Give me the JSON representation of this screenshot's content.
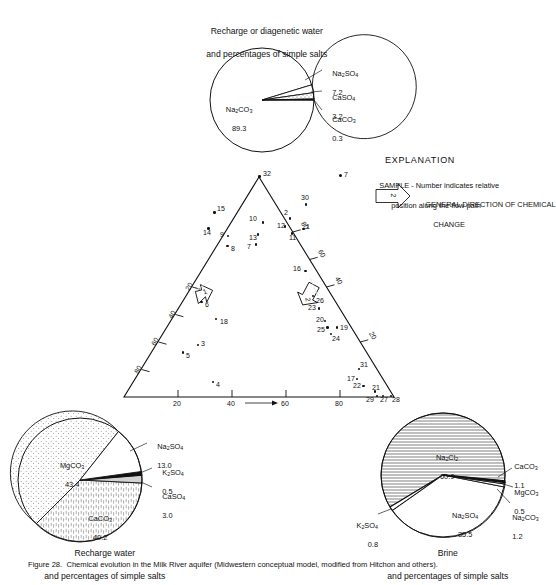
{
  "figure": {
    "caption": "Figure 28.  Chemical evolution in the Milk River aquifer (Midwestern conceptual model, modified from Hitchon and others)."
  },
  "top_pie": {
    "title_line1": "Recharge or diagenetic water",
    "title_line2": "and percentages of simple salts",
    "slices": [
      {
        "name": "Na2CO3",
        "label_html": "Na<sub>2</sub>CO<sub>3</sub>",
        "value": "89.3",
        "fill": "white"
      },
      {
        "name": "Na2SO4",
        "label_html": "Na<sub>2</sub>SO<sub>4</sub>",
        "value": "7.2",
        "fill": "white"
      },
      {
        "name": "CaSO4",
        "label_html": "CaSO<sub>4</sub>",
        "value": "3.2",
        "fill": "dots"
      },
      {
        "name": "CaCO3",
        "label_html": "CaCO<sub>3</sub>",
        "value": "0.3",
        "fill": "black"
      }
    ]
  },
  "left_pie": {
    "title_line1": "Recharge water",
    "title_line2": "and percentages of simple salts",
    "slices": [
      {
        "name": "MgCO3",
        "label_html": "MgCO<sub>3</sub>",
        "value": "43.4",
        "fill": "dots"
      },
      {
        "name": "CaCO3",
        "label_html": "CaCO<sub>3</sub>",
        "value": "40.2",
        "fill": "dashes"
      },
      {
        "name": "Na2SO4",
        "label_html": "Na<sub>2</sub>SO<sub>4</sub>",
        "value": "13.0",
        "fill": "white"
      },
      {
        "name": "K2SO4",
        "label_html": "K<sub>2</sub>SO<sub>4</sub>",
        "value": "0.5",
        "fill": "black"
      },
      {
        "name": "CaSO4",
        "label_html": "CaSO<sub>4</sub>",
        "value": "3.0",
        "fill": "gray"
      }
    ]
  },
  "right_pie": {
    "title_line1": "Brine",
    "title_line2": "and percentages of simple salts",
    "slices": [
      {
        "name": "Na2Cl2",
        "label_html": "Na<sub>2</sub>Cl<sub>2</sub>",
        "value": "60.9",
        "fill": "hlines"
      },
      {
        "name": "Na2SO4",
        "label_html": "Na<sub>2</sub>SO<sub>4</sub>",
        "value": "35.5",
        "fill": "white"
      },
      {
        "name": "CaCO3",
        "label_html": "CaCO<sub>3</sub>",
        "value": "1.1",
        "fill": "black"
      },
      {
        "name": "MgCO3",
        "label_html": "MgCO<sub>3</sub>",
        "value": "0.5",
        "fill": "white"
      },
      {
        "name": "Na2CO3",
        "label_html": "Na<sub>2</sub>CO<sub>3</sub>",
        "value": "1.2",
        "fill": "white"
      },
      {
        "name": "K2SO4",
        "label_html": "K<sub>2</sub>SO<sub>4</sub>",
        "value": "0.8",
        "fill": "white"
      }
    ]
  },
  "explanation": {
    "heading": "EXPLANATION",
    "sample_marker": "7",
    "sample_line1": "SAMPLE - Number indicates relative",
    "sample_line2": "position along the flow path",
    "arrow_marker": "2",
    "direction_line1": "GENERAL DIRECTION OF CHEMICAL",
    "direction_line2": "CHANGE"
  },
  "ternary": {
    "left_axis_ticks": [
      "20",
      "40",
      "60",
      "80"
    ],
    "right_axis_ticks": [
      "80",
      "60",
      "40",
      "20"
    ],
    "bottom_axis_ticks": [
      "20",
      "40",
      "60",
      "80"
    ],
    "arrow_labels": [
      "1",
      "2"
    ],
    "samples": [
      {
        "id": "32",
        "x": 259.5,
        "y": 176.5,
        "lx": 263,
        "ly": 172
      },
      {
        "id": "30",
        "x": 306.0,
        "y": 204.5,
        "lx": 301,
        "ly": 196
      },
      {
        "id": "15",
        "x": 214.5,
        "y": 212.5,
        "lx": 217,
        "ly": 207
      },
      {
        "id": "2",
        "x": 290.0,
        "y": 218.5,
        "lx": 284,
        "ly": 211
      },
      {
        "id": "10",
        "x": 263.0,
        "y": 222.5,
        "lx": 249,
        "ly": 217
      },
      {
        "id": "12",
        "x": 285.0,
        "y": 226.5,
        "lx": 277,
        "ly": 224
      },
      {
        "id": "1",
        "x": 303.5,
        "y": 229.0,
        "lx": 306,
        "ly": 225
      },
      {
        "id": "14",
        "x": 208.5,
        "y": 228.5,
        "lx": 203,
        "ly": 231
      },
      {
        "id": "11",
        "x": 292.0,
        "y": 233.5,
        "lx": 289,
        "ly": 236
      },
      {
        "id": "9",
        "x": 228.0,
        "y": 236.0,
        "lx": 220,
        "ly": 233
      },
      {
        "id": "13",
        "x": 258.0,
        "y": 234.5,
        "lx": 249,
        "ly": 236
      },
      {
        "id": "8",
        "x": 227.5,
        "y": 246.0,
        "lx": 231,
        "ly": 247
      },
      {
        "id": "7",
        "x": 256.0,
        "y": 244.5,
        "lx": 247,
        "ly": 245
      },
      {
        "id": "16",
        "x": 305.5,
        "y": 271.0,
        "lx": 293,
        "ly": 267
      },
      {
        "id": "26",
        "x": 313.0,
        "y": 296.0,
        "lx": 316,
        "ly": 299
      },
      {
        "id": "6",
        "x": 201.5,
        "y": 302.0,
        "lx": 205,
        "ly": 303
      },
      {
        "id": "23",
        "x": 319.0,
        "y": 308.5,
        "lx": 308,
        "ly": 306
      },
      {
        "id": "18",
        "x": 216.0,
        "y": 319.0,
        "lx": 220,
        "ly": 320
      },
      {
        "id": "20",
        "x": 325.0,
        "y": 321.0,
        "lx": 316,
        "ly": 318
      },
      {
        "id": "19",
        "x": 337.0,
        "y": 327.5,
        "lx": 340,
        "ly": 326
      },
      {
        "id": "25",
        "x": 327.5,
        "y": 327.5,
        "lx": 317,
        "ly": 328
      },
      {
        "id": "24",
        "x": 331.0,
        "y": 334.0,
        "lx": 332,
        "ly": 337
      },
      {
        "id": "3",
        "x": 198.0,
        "y": 345.0,
        "lx": 201,
        "ly": 342
      },
      {
        "id": "31",
        "x": 359.0,
        "y": 369.0,
        "lx": 360,
        "ly": 363
      },
      {
        "id": "5",
        "x": 183.0,
        "y": 352.5,
        "lx": 186,
        "ly": 354
      },
      {
        "id": "17",
        "x": 357.0,
        "y": 379.0,
        "lx": 347,
        "ly": 377
      },
      {
        "id": "22",
        "x": 363.5,
        "y": 386.0,
        "lx": 353,
        "ly": 384
      },
      {
        "id": "21",
        "x": 375.0,
        "y": 391.5,
        "lx": 372,
        "ly": 386
      },
      {
        "id": "4",
        "x": 213.0,
        "y": 382.0,
        "lx": 216,
        "ly": 383
      },
      {
        "id": "29",
        "x": 377.0,
        "y": 396.0,
        "lx": 366,
        "ly": 398
      },
      {
        "id": "27",
        "x": 383.0,
        "y": 396.0,
        "lx": 380,
        "ly": 398
      },
      {
        "id": "28",
        "x": 391.0,
        "y": 396.0,
        "lx": 392,
        "ly": 398
      }
    ]
  }
}
